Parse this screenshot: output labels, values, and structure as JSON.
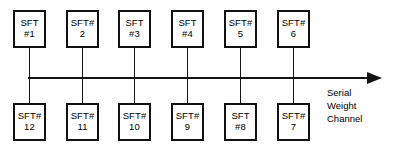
{
  "diagram": {
    "bus": {
      "label_lines": [
        "Serial",
        "Weight",
        "Channel"
      ],
      "arrow_direction": "right",
      "line_color": "#141414"
    },
    "node_box": {
      "width": 33,
      "height": 38,
      "border_color": "#111111",
      "fill_color": "#ffffff"
    },
    "top_row": [
      {
        "name": "sft-1",
        "line1": "SFT",
        "line2": "#1",
        "x": 13
      },
      {
        "name": "sft-2",
        "line1": "SFT#",
        "line2": "2",
        "x": 66
      },
      {
        "name": "sft-3",
        "line1": "SFT",
        "line2": "#3",
        "x": 118
      },
      {
        "name": "sft-4",
        "line1": "SFT",
        "line2": "#4",
        "x": 171
      },
      {
        "name": "sft-5",
        "line1": "SFT#",
        "line2": "5",
        "x": 224
      },
      {
        "name": "sft-6",
        "line1": "SFT#",
        "line2": "6",
        "x": 277
      }
    ],
    "bottom_row": [
      {
        "name": "sft-12",
        "line1": "SFT#",
        "line2": "12",
        "x": 13
      },
      {
        "name": "sft-11",
        "line1": "SFT#",
        "line2": "11",
        "x": 66
      },
      {
        "name": "sft-10",
        "line1": "SFT#",
        "line2": "10",
        "x": 118
      },
      {
        "name": "sft-9",
        "line1": "SFT#",
        "line2": "9",
        "x": 171
      },
      {
        "name": "sft-8",
        "line1": "SFT",
        "line2": "#8",
        "x": 224
      },
      {
        "name": "sft-7",
        "line1": "SFT#",
        "line2": "7",
        "x": 277
      }
    ],
    "geometry": {
      "top_y": 10,
      "bottom_y": 103,
      "bus_y": 77,
      "bus_x_start": 28,
      "bus_x_end": 368,
      "arrow_x": 367,
      "label_x": 327,
      "label_y": 87
    }
  }
}
